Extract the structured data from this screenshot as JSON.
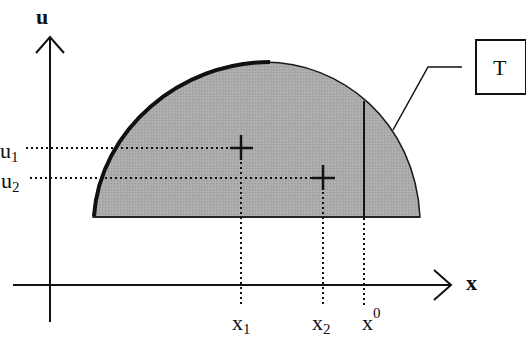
{
  "axes": {
    "vertical_label": "u",
    "horizontal_label": "x"
  },
  "region": {
    "label": "T",
    "fill_color": "#a9a9a9",
    "edge_color": "#1a1a1a"
  },
  "points": [
    {
      "name": "point-1",
      "x_label": "x",
      "x_sub": "1",
      "u_label": "u",
      "u_sub": "1"
    },
    {
      "name": "point-2",
      "x_label": "x",
      "x_sub": "2",
      "u_label": "u",
      "u_sub": "2"
    }
  ],
  "threshold": {
    "label": "x",
    "sup": "0"
  }
}
